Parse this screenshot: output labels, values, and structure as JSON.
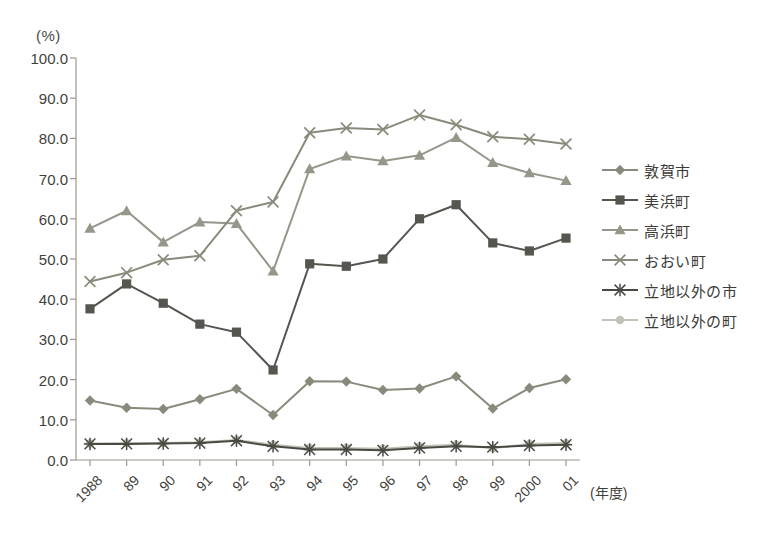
{
  "chart_data": {
    "type": "line",
    "title": "",
    "xlabel": "(年度)",
    "ylabel": "(%)",
    "ylim": [
      0,
      100
    ],
    "ytick_step": 10,
    "grid": false,
    "legend_position": "right",
    "categories": [
      "1988",
      "89",
      "90",
      "91",
      "92",
      "93",
      "94",
      "95",
      "96",
      "97",
      "98",
      "99",
      "2000",
      "01"
    ],
    "ytick_labels": [
      "100.0",
      "90.0",
      "80.0",
      "70.0",
      "60.0",
      "50.0",
      "40.0",
      "30.0",
      "20.0",
      "10.0",
      "0.0"
    ],
    "series": [
      {
        "name": "敦賀市",
        "marker": "diamond",
        "color": "#8a8a7c",
        "values": [
          14.8,
          13.0,
          12.7,
          15.1,
          17.7,
          11.2,
          19.6,
          19.5,
          17.4,
          17.8,
          20.8,
          12.8,
          17.9,
          20.1
        ]
      },
      {
        "name": "美浜町",
        "marker": "square",
        "color": "#565650",
        "values": [
          37.6,
          43.8,
          39.0,
          33.8,
          31.8,
          22.4,
          48.8,
          48.2,
          50.0,
          60.0,
          63.5,
          54.0,
          52.0,
          55.2
        ]
      },
      {
        "name": "高浜町",
        "marker": "triangle",
        "color": "#96968a",
        "values": [
          57.6,
          62.0,
          54.2,
          59.2,
          58.8,
          47.0,
          72.4,
          75.6,
          74.4,
          75.8,
          80.2,
          74.0,
          71.4,
          69.5
        ]
      },
      {
        "name": "おおい町",
        "marker": "x",
        "color": "#8a8a7c",
        "values": [
          44.4,
          46.6,
          49.8,
          50.8,
          62.0,
          64.2,
          81.4,
          82.6,
          82.2,
          85.8,
          83.4,
          80.4,
          79.8,
          78.6
        ]
      },
      {
        "name": "立地以外の市",
        "marker": "asterisk",
        "color": "#4a4a44",
        "values": [
          4.0,
          4.0,
          4.1,
          4.2,
          4.8,
          3.4,
          2.6,
          2.6,
          2.4,
          3.0,
          3.4,
          3.2,
          3.6,
          3.8
        ]
      },
      {
        "name": "立地以外の町",
        "marker": "circle",
        "color": "#c2c2b6",
        "values": [
          4.1,
          4.2,
          4.2,
          4.4,
          5.0,
          3.8,
          3.0,
          3.0,
          2.8,
          3.4,
          3.8,
          2.9,
          4.0,
          4.2
        ]
      }
    ]
  },
  "axis": {
    "unit_label": "(%)",
    "x_caption": "(年度)"
  }
}
